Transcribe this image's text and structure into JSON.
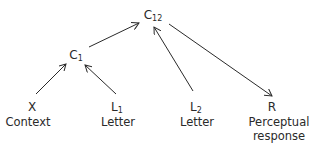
{
  "diagram": {
    "type": "directed-graph",
    "nodes": {
      "c12": {
        "symbol": "C",
        "subscript": "12"
      },
      "c1": {
        "symbol": "C",
        "subscript": "1"
      },
      "x": {
        "symbol": "X",
        "subscript": "",
        "label_line1": "Context",
        "label_line2": ""
      },
      "l1": {
        "symbol": "L",
        "subscript": "1",
        "label_line1": "Letter",
        "label_line2": ""
      },
      "l2": {
        "symbol": "L",
        "subscript": "2",
        "label_line1": "Letter",
        "label_line2": ""
      },
      "r": {
        "symbol": "R",
        "subscript": "",
        "label_line1": "Perceptual",
        "label_line2": "response"
      }
    },
    "edges": [
      {
        "from": "X",
        "to": "C1"
      },
      {
        "from": "L1",
        "to": "C1"
      },
      {
        "from": "C1",
        "to": "C12"
      },
      {
        "from": "L2",
        "to": "C12"
      },
      {
        "from": "C12",
        "to": "R"
      }
    ],
    "colors": {
      "stroke": "#2a2a2a",
      "text": "#2a2a2a",
      "background": "#ffffff"
    }
  }
}
